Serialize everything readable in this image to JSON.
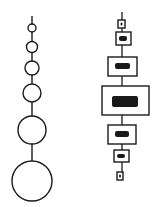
{
  "diagram": {
    "background": "#ffffff",
    "stroke": "#1a1a1a",
    "left_chain": {
      "type": "circles",
      "cx": 32,
      "stem_top": 16,
      "circles": [
        {
          "cy": 28,
          "r": 4
        },
        {
          "cy": 47,
          "r": 5.5
        },
        {
          "cy": 68,
          "r": 7
        },
        {
          "cy": 93,
          "r": 9
        },
        {
          "cy": 130,
          "r": 14
        },
        {
          "cy": 181,
          "r": 20
        }
      ]
    },
    "right_chain": {
      "type": "boxes",
      "cx": 122,
      "stem_top": 12,
      "boxes": [
        {
          "x": 118,
          "y": 20,
          "w": 7,
          "h": 8,
          "ix": 120.5,
          "iy": 22.5,
          "iw": 2,
          "ih": 3
        },
        {
          "x": 116,
          "y": 32,
          "w": 15,
          "h": 13,
          "ix": 119,
          "iy": 36,
          "iw": 8,
          "ih": 5
        },
        {
          "x": 108,
          "y": 57,
          "w": 29,
          "h": 19,
          "ix": 115,
          "iy": 63,
          "iw": 15,
          "ih": 6
        },
        {
          "x": 102,
          "y": 86,
          "w": 47,
          "h": 29,
          "ix": 112,
          "iy": 96,
          "iw": 26,
          "ih": 11
        },
        {
          "x": 108,
          "y": 125,
          "w": 28,
          "h": 19,
          "ix": 115,
          "iy": 131,
          "iw": 14,
          "ih": 6
        },
        {
          "x": 114,
          "y": 150,
          "w": 15,
          "h": 12,
          "ix": 117,
          "iy": 154,
          "iw": 8,
          "ih": 4
        },
        {
          "x": 117,
          "y": 172,
          "w": 6,
          "h": 8,
          "ix": 119,
          "iy": 174.5,
          "iw": 2,
          "ih": 3
        }
      ]
    }
  }
}
